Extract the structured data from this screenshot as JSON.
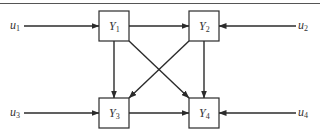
{
  "diagram": {
    "type": "block-diagram",
    "colors": {
      "line": "#2b2b2b",
      "rule": "#555555",
      "background": "#ffffff"
    },
    "blocks": [
      {
        "id": "Y1",
        "label": "Y",
        "sub": "1",
        "x": 99,
        "y": 11,
        "w": 30,
        "h": 30
      },
      {
        "id": "Y2",
        "label": "Y",
        "sub": "2",
        "x": 189,
        "y": 11,
        "w": 30,
        "h": 30
      },
      {
        "id": "Y3",
        "label": "Y",
        "sub": "3",
        "x": 99,
        "y": 98,
        "w": 30,
        "h": 30
      },
      {
        "id": "Y4",
        "label": "Y",
        "sub": "4",
        "x": 189,
        "y": 98,
        "w": 30,
        "h": 30
      }
    ],
    "inputs": [
      {
        "id": "u1",
        "label": "u",
        "sub": "1",
        "target": "Y1"
      },
      {
        "id": "u2",
        "label": "u",
        "sub": "2",
        "target": "Y2"
      },
      {
        "id": "u3",
        "label": "u",
        "sub": "3",
        "target": "Y3"
      },
      {
        "id": "u4",
        "label": "u",
        "sub": "4",
        "target": "Y4"
      }
    ],
    "edges": [
      {
        "from": "Y1",
        "to": "Y2"
      },
      {
        "from": "Y1",
        "to": "Y3"
      },
      {
        "from": "Y1",
        "to": "Y4"
      },
      {
        "from": "Y2",
        "to": "Y3"
      },
      {
        "from": "Y2",
        "to": "Y4"
      },
      {
        "from": "Y3",
        "to": "Y4"
      }
    ]
  }
}
